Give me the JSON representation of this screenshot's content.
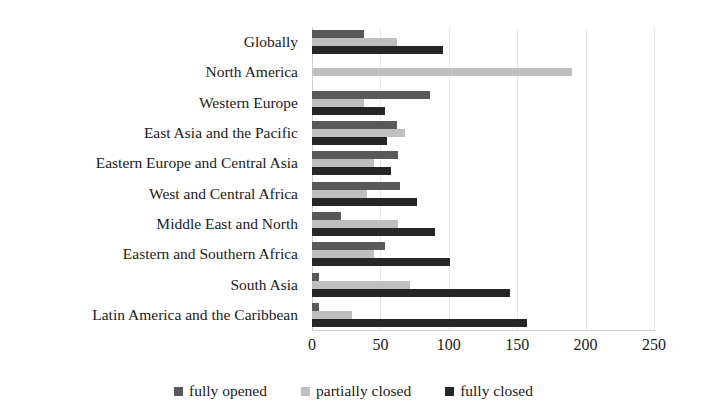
{
  "chart_data": {
    "type": "bar",
    "orientation": "horizontal",
    "title": "",
    "subtitle": "",
    "xlabel": "",
    "ylabel": "",
    "xlim": [
      0,
      250
    ],
    "xticks": [
      0,
      50,
      100,
      150,
      200,
      250
    ],
    "xtick_labels": [
      "0",
      "50",
      "100",
      "150",
      "200",
      "250"
    ],
    "grid": true,
    "grid_axis": "x",
    "legend_position": "bottom",
    "categories": [
      "Globally",
      "North America",
      "Western Europe",
      "East Asia and the Pacific",
      "Eastern Europe and Central Asia",
      "West and Central Africa",
      "Middle East and North",
      "Eastern and Southern Africa",
      "South Asia",
      "Latin America and the Caribbean"
    ],
    "series": [
      {
        "name": "fully opened",
        "color": "#595959",
        "values": [
          38,
          0,
          86,
          62,
          63,
          64,
          21,
          53,
          5,
          5
        ]
      },
      {
        "name": "partially closed",
        "color": "#bfbfbf",
        "values": [
          62,
          190,
          38,
          68,
          45,
          40,
          63,
          45,
          72,
          29
        ]
      },
      {
        "name": "fully closed",
        "color": "#262626",
        "values": [
          96,
          0,
          53,
          55,
          58,
          77,
          90,
          101,
          145,
          157
        ]
      }
    ]
  }
}
